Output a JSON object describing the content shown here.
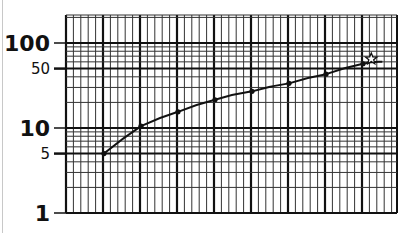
{
  "chart_data": {
    "type": "line",
    "title": "",
    "xlabel": "",
    "ylabel": "",
    "y_scale": "log",
    "ylim": [
      1,
      200
    ],
    "grid": true,
    "y_tick_labels": [
      {
        "value": 100,
        "label": "100"
      },
      {
        "value": 50,
        "label": "50"
      },
      {
        "value": 10,
        "label": "10"
      },
      {
        "value": 5,
        "label": "5"
      },
      {
        "value": 1,
        "label": "1"
      }
    ],
    "x_major_divisions": 9,
    "x_minor_per_major": 4,
    "x": [
      1,
      2,
      3,
      4,
      5,
      6,
      7,
      8
    ],
    "series": [
      {
        "name": "curve",
        "values": [
          5,
          10.5,
          15.5,
          21.5,
          27,
          33.5,
          43,
          57
        ]
      }
    ],
    "end_marker": {
      "symbol": "star",
      "x": 8.25,
      "value": 65
    },
    "line_extension_to_x": 8.55,
    "line_extension_value": 60
  },
  "style": {
    "ink": "#111111",
    "grid_minor": "#333333",
    "background": "#ffffff"
  }
}
